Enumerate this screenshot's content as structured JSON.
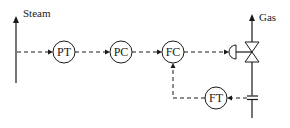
{
  "diagram": {
    "title": "",
    "streams": {
      "steam": {
        "label": "Steam"
      },
      "gas": {
        "label": "Gas"
      }
    },
    "instruments": [
      {
        "id": "pt",
        "label": "PT",
        "role": "pressure transmitter"
      },
      {
        "id": "pc",
        "label": "PC",
        "role": "pressure controller"
      },
      {
        "id": "fc",
        "label": "FC",
        "role": "flow controller"
      },
      {
        "id": "ft",
        "label": "FT",
        "role": "flow transmitter"
      }
    ],
    "devices": [
      {
        "id": "control-valve",
        "label": ""
      },
      {
        "id": "orifice-plate",
        "label": ""
      }
    ],
    "connections": [
      {
        "from": "steam-line",
        "to": "PT",
        "type": "signal"
      },
      {
        "from": "PT",
        "to": "PC",
        "type": "signal"
      },
      {
        "from": "PC",
        "to": "FC",
        "type": "signal"
      },
      {
        "from": "FC",
        "to": "control-valve",
        "type": "signal"
      },
      {
        "from": "orifice-plate",
        "to": "FT",
        "type": "signal"
      },
      {
        "from": "FT",
        "to": "FC",
        "type": "signal"
      }
    ]
  }
}
